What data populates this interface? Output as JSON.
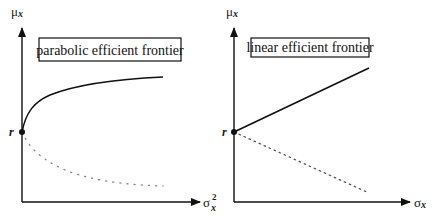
{
  "panels": [
    {
      "title": "parabolic efficient frontier",
      "y_axis_label": "μ",
      "y_axis_sub": "x",
      "x_axis_label": "σ",
      "x_axis_sup": "2",
      "x_axis_sub": "x",
      "origin_point_label": "r",
      "frontier_shape": "parabolic",
      "upper_branch": "solid",
      "lower_branch": "dotted"
    },
    {
      "title": "linear efficient frontier",
      "y_axis_label": "μ",
      "y_axis_sub": "x",
      "x_axis_label": "σ",
      "x_axis_sub": "x",
      "origin_point_label": "r",
      "frontier_shape": "linear",
      "upper_branch": "solid",
      "lower_branch": "dotted"
    }
  ],
  "colors": {
    "ink": "#111111",
    "dotted": "#777777",
    "background": "#ffffff"
  }
}
